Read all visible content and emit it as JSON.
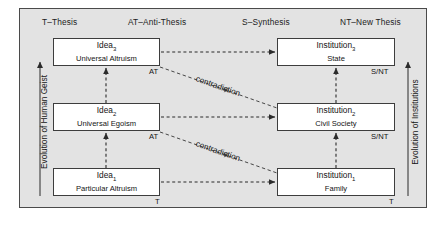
{
  "diagram": {
    "title_absent": true,
    "legend_headers": [
      {
        "id": "thesis",
        "label": "T–Thesis",
        "x": 42,
        "y": 18
      },
      {
        "id": "anti-thesis",
        "label": "AT–Anti-Thesis",
        "x": 128,
        "y": 18
      },
      {
        "id": "synthesis",
        "label": "S–Synthesis",
        "x": 242,
        "y": 18
      },
      {
        "id": "new-thesis",
        "label": "NT–New Thesis",
        "x": 340,
        "y": 18
      }
    ],
    "left_axis": {
      "label": "Evolution of Human Geist",
      "direction": "up"
    },
    "right_axis": {
      "label": "Evolution of Institutions",
      "direction": "up"
    },
    "idea_boxes": [
      {
        "id": "idea-3",
        "title": "Idea",
        "sub": "3",
        "subtitle": "Universal Altruism",
        "corner": "AT",
        "row": "top"
      },
      {
        "id": "idea-2",
        "title": "Idea",
        "sub": "2",
        "subtitle": "Universal Egoism",
        "corner": "AT",
        "row": "middle"
      },
      {
        "id": "idea-1",
        "title": "Idea",
        "sub": "1",
        "subtitle": "Particular Altruism",
        "corner": "T",
        "row": "bottom"
      }
    ],
    "institution_boxes": [
      {
        "id": "institution-3",
        "title": "Institution",
        "sub": "3",
        "subtitle": "State",
        "corner": "S/NT",
        "row": "top"
      },
      {
        "id": "institution-2",
        "title": "Institution",
        "sub": "2",
        "subtitle": "Civil Society",
        "corner": "S/NT",
        "row": "middle"
      },
      {
        "id": "institution-1",
        "title": "Institution",
        "sub": "1",
        "subtitle": "Family",
        "corner": "T",
        "row": "bottom"
      }
    ],
    "contradiction_labels": [
      {
        "id": "contradiction-upper",
        "label": "contradiction"
      },
      {
        "id": "contradiction-lower",
        "label": "contradiction"
      }
    ],
    "colors": {
      "panel_background": "#e3e3e3",
      "panel_border": "#4a4a4a",
      "box_fill": "#ffffff",
      "box_border": "#3d3d3d",
      "text": "#141414",
      "arrow": "#2b2b2b"
    }
  }
}
